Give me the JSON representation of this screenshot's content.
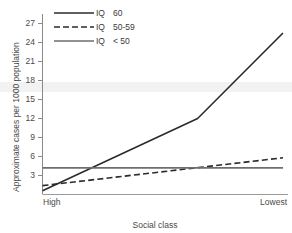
{
  "chart_data": {
    "type": "line",
    "title": "",
    "subtitle": "",
    "xlabel": "Social class",
    "ylabel": "Approximate cases per 1000 population",
    "x": [
      0,
      1
    ],
    "xtick_labels": [
      "High",
      "Lowest"
    ],
    "xtick_positions": [
      0,
      1
    ],
    "ytick_labels": [
      "3",
      "6",
      "9",
      "12",
      "15",
      "18",
      "21",
      "24",
      "27"
    ],
    "ytick_values": [
      3,
      6,
      9,
      12,
      15,
      18,
      21,
      24,
      27
    ],
    "ylim": [
      0,
      28.5
    ],
    "xlim": [
      0,
      1
    ],
    "grid": false,
    "legend_position": "upper-left",
    "series": [
      {
        "name": "IQ 60",
        "legend_label_prefix": "IQ",
        "legend_label_value": "60",
        "style": "solid",
        "color": "#2b2b2b",
        "width": 1.6,
        "points": [
          {
            "x": 0.0,
            "y": 0.6
          },
          {
            "x": 0.645,
            "y": 12.0
          },
          {
            "x": 1.0,
            "y": 25.5
          }
        ]
      },
      {
        "name": "IQ 50-59",
        "legend_label_prefix": "IQ",
        "legend_label_value": "50-59",
        "style": "dashed",
        "color": "#2b2b2b",
        "width": 1.6,
        "points": [
          {
            "x": 0.0,
            "y": 1.4
          },
          {
            "x": 1.0,
            "y": 5.8
          }
        ]
      },
      {
        "name": "IQ <50",
        "legend_label_prefix": "IQ",
        "legend_label_value": "< 50",
        "style": "solid",
        "color": "#6e6e6e",
        "width": 1.6,
        "points": [
          {
            "x": 0.0,
            "y": 4.2
          },
          {
            "x": 1.0,
            "y": 4.2
          }
        ]
      }
    ],
    "axis_color": "#8a8a8a",
    "baseline_color": "#9a9a9a",
    "background": "#ffffff",
    "band_color": "#f2f2f2"
  },
  "legend": {
    "entries": [
      {
        "prefix": "IQ",
        "value": "60"
      },
      {
        "prefix": "IQ",
        "value": "50-59"
      },
      {
        "prefix": "IQ",
        "value": "< 50"
      }
    ]
  },
  "axes": {
    "y_title": "Approximate cases per 1000 population",
    "x_title": "Social class",
    "y_ticks": [
      "3",
      "6",
      "9",
      "12",
      "15",
      "18",
      "21",
      "24",
      "27"
    ],
    "x_ticks": [
      "High",
      "Lowest"
    ]
  }
}
